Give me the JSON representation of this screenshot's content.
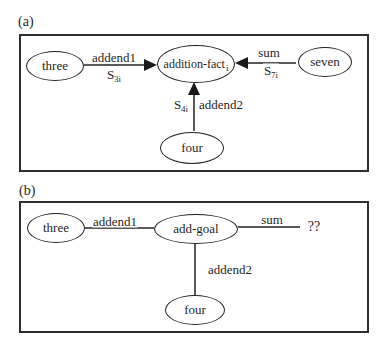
{
  "colors": {
    "ink": "#1f1f1f",
    "background": "#ffffff"
  },
  "panel_a": {
    "label": "(a)",
    "nodes": {
      "three": "three",
      "addition_fact": {
        "base": "addition-fact",
        "sub": "i"
      },
      "seven": "seven",
      "four": "four"
    },
    "edges": {
      "addend1": {
        "label": "addend1",
        "strength_base": "S",
        "strength_sub": "3i"
      },
      "sum": {
        "label": "sum",
        "strength_base": "S",
        "strength_sub": "7i"
      },
      "addend2": {
        "label": "addend2",
        "strength_base": "S",
        "strength_sub": "4i"
      }
    }
  },
  "panel_b": {
    "label": "(b)",
    "nodes": {
      "three": "three",
      "add_goal": "add-goal",
      "four": "four",
      "result_unknown": "??"
    },
    "edges": {
      "addend1": {
        "label": "addend1"
      },
      "sum": {
        "label": "sum"
      },
      "addend2": {
        "label": "addend2"
      }
    }
  }
}
